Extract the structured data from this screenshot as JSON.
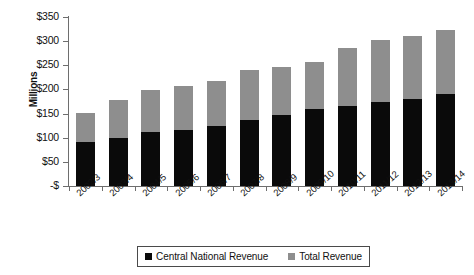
{
  "chart_data": {
    "type": "bar",
    "title": "",
    "subtitle": "",
    "xlabel": "",
    "ylabel": "Millions",
    "stacked": true,
    "grid": false,
    "legend_position": "bottom",
    "ylim": [
      0,
      350
    ],
    "ytick_values": [
      0,
      50,
      100,
      150,
      200,
      250,
      300,
      350
    ],
    "ytick_labels": [
      "-$",
      "$50",
      "$100",
      "$150",
      "$200",
      "$250",
      "$300",
      "$350"
    ],
    "categories": [
      "2002/3",
      "2003/4",
      "2004/5",
      "2005/6",
      "2006/7",
      "2007/8",
      "2008/9",
      "2009/10",
      "2010/11",
      "2011/12",
      "2012/13",
      "2013/14"
    ],
    "series": [
      {
        "name": "Central National Revenue",
        "color": "#0a0a0a",
        "values": [
          92,
          100,
          111,
          116,
          125,
          136,
          147,
          160,
          165,
          173,
          180,
          190
        ]
      },
      {
        "name": "Total Revenue",
        "color": "#8e8e8e",
        "values": [
          152,
          179,
          198,
          207,
          217,
          240,
          247,
          257,
          285,
          303,
          310,
          323
        ]
      }
    ]
  },
  "legend": {
    "items": [
      {
        "label": "Central National  Revenue",
        "color": "#0a0a0a"
      },
      {
        "label": "Total Revenue",
        "color": "#8e8e8e"
      }
    ]
  }
}
